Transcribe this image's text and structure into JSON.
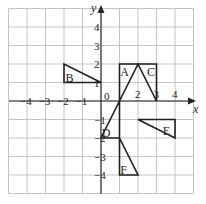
{
  "diagram": {
    "grid": {
      "x_min": -5,
      "x_max": 5,
      "y_min": -5,
      "y_max": 5,
      "origin_px": [
        101,
        101
      ],
      "cell_px": 18.5
    },
    "axes": {
      "x_label": "x",
      "y_label": "y",
      "origin_label": "0",
      "x_ticks": [
        {
          "value": -4,
          "label": "−4"
        },
        {
          "value": -3,
          "label": "−3"
        },
        {
          "value": -2,
          "label": "−2"
        },
        {
          "value": -1,
          "label": "−1"
        },
        {
          "value": 2,
          "label": "2"
        },
        {
          "value": 3,
          "label": "3"
        },
        {
          "value": 4,
          "label": "4"
        }
      ],
      "y_ticks": [
        {
          "value": 4,
          "label": "4"
        },
        {
          "value": 3,
          "label": "3"
        },
        {
          "value": 2,
          "label": "2"
        },
        {
          "value": 1,
          "label": "1"
        },
        {
          "value": -1,
          "label": "−1"
        },
        {
          "value": -2,
          "label": "−2"
        },
        {
          "value": -3,
          "label": "−3"
        },
        {
          "value": -4,
          "label": "−4"
        }
      ]
    },
    "shapes": [
      {
        "label": "A",
        "points": [
          [
            1,
            2
          ],
          [
            2,
            2
          ],
          [
            1,
            0
          ]
        ],
        "label_at": [
          1.25,
          1.55
        ]
      },
      {
        "label": "B",
        "points": [
          [
            -2,
            2
          ],
          [
            -2,
            1
          ],
          [
            0,
            1
          ]
        ],
        "label_at": [
          -1.7,
          1.25
        ]
      },
      {
        "label": "C",
        "points": [
          [
            2,
            2
          ],
          [
            3,
            2
          ],
          [
            3,
            0
          ]
        ],
        "label_at": [
          2.7,
          1.55
        ]
      },
      {
        "label": "D",
        "points": [
          [
            0,
            -2
          ],
          [
            1,
            -2
          ],
          [
            1,
            0
          ]
        ],
        "label_at": [
          0.25,
          -1.75
        ]
      },
      {
        "label": "E",
        "points": [
          [
            2,
            -1
          ],
          [
            4,
            -1
          ],
          [
            4,
            -2
          ]
        ],
        "label_at": [
          3.55,
          -1.6
        ]
      },
      {
        "label": "F",
        "points": [
          [
            1,
            -2
          ],
          [
            1,
            -4
          ],
          [
            2,
            -4
          ]
        ],
        "label_at": [
          1.25,
          -3.75
        ]
      }
    ],
    "colors": {
      "grid": "#bdbdbd",
      "axis": "#222222",
      "shape_stroke": "#1f1f1f",
      "background": "#ffffff"
    }
  }
}
